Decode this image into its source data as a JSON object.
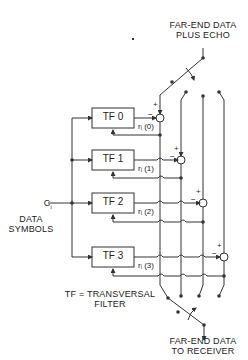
{
  "diagram": {
    "top_label": [
      "FAR-END DATA",
      "PLUS ECHO"
    ],
    "bottom_label": [
      "FAR-END DATA",
      "TO RECEIVER"
    ],
    "input_label": {
      "symbol": "C",
      "subscript": "i",
      "text": [
        "DATA",
        "SYMBOLS"
      ]
    },
    "legend": [
      "TF = TRANSVERSAL",
      "FILTER"
    ],
    "filters": [
      {
        "name": "TF 0",
        "output": "rᵢ (0)"
      },
      {
        "name": "TF 1",
        "output": "rᵢ (1)"
      },
      {
        "name": "TF 2",
        "output": "rᵢ (2)"
      },
      {
        "name": "TF 3",
        "output": "rᵢ (3)"
      }
    ],
    "summer_signs": {
      "plus": "+",
      "minus": "−"
    },
    "colors": {
      "line": "#333333",
      "background": "#ffffff"
    }
  }
}
